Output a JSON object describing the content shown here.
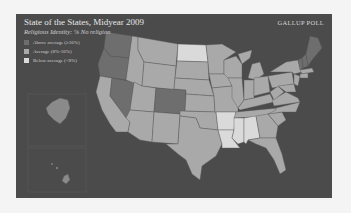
{
  "header": {
    "title": "State of the States, Midyear 2009",
    "subtitle": "Religious Identity: % No religion",
    "brand": "GALLUP POLL"
  },
  "legend": {
    "items": [
      {
        "label": "Above average (≥16%)",
        "color": "#6e6e6e"
      },
      {
        "label": "Average (8%-16%)",
        "color": "#a9a9a9"
      },
      {
        "label": "Below average (<8%)",
        "color": "#dadada"
      }
    ]
  },
  "colors": {
    "background": "#4b4b4b",
    "page": "#f4f4f4",
    "above": "#6e6e6e",
    "average": "#a9a9a9",
    "below": "#dadada"
  },
  "map": {
    "above_average_states": [
      "Washington",
      "Oregon",
      "Nevada",
      "Colorado",
      "Vermont",
      "New Hampshire",
      "Maine"
    ],
    "below_average_states": [
      "North Dakota",
      "Arkansas",
      "Louisiana",
      "Mississippi",
      "Alabama"
    ],
    "average_states": "all other states"
  }
}
